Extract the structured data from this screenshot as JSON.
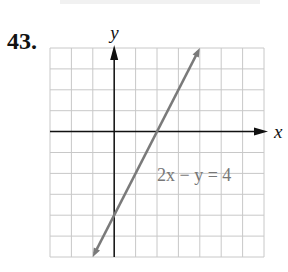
{
  "problem_number": "43.",
  "chart_data": {
    "type": "line",
    "title": "",
    "equation": "2x − y = 4",
    "equation_label": "2x − y = 4",
    "xlabel": "x",
    "ylabel": "y",
    "xlim": [
      -3,
      7
    ],
    "ylim": [
      -6,
      4
    ],
    "grid": true,
    "grid_step": 1,
    "series": [
      {
        "name": "2x − y = 4",
        "x": [
          -1,
          4
        ],
        "y": [
          -6,
          4
        ],
        "color": "#7a7a7a",
        "arrows": "both"
      }
    ],
    "intercepts": {
      "x_intercept": [
        2,
        0
      ],
      "y_intercept": [
        0,
        -4
      ]
    }
  }
}
